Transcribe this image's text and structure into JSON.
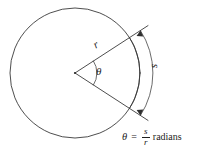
{
  "figure": {
    "type": "geometry-diagram",
    "background_color": "#ffffff",
    "stroke_color": "#3a3a3a",
    "text_color": "#1d1d1d"
  },
  "labels": {
    "radius": "r",
    "angle": "θ",
    "arc": "s"
  },
  "formula": {
    "theta": "θ",
    "equals": "=",
    "numerator": "s",
    "denominator": "r",
    "units": "radians",
    "full_text": "θ = s/r radians"
  },
  "geometry": {
    "circle": {
      "center_x": 75,
      "center_y": 73,
      "radius": 65
    },
    "sector": {
      "half_angle_degrees": 33,
      "upper_ray_angle_degrees": -33,
      "lower_ray_angle_degrees": 33,
      "ray_overshoot_px": 22
    },
    "angle_arc": {
      "radius_px": 22
    },
    "measure_arc": {
      "radius_px": 78,
      "arrowheads": 2
    }
  }
}
